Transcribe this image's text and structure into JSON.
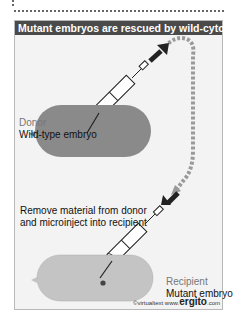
{
  "title": "Mutant embryos are rescued by wild-cytoplasm",
  "donor": {
    "role": "Donor",
    "description": "Wild-type embryo"
  },
  "instruction": {
    "line1": "Remove material from donor",
    "line2": "and microinject into recipient"
  },
  "recipient": {
    "role": "Recipient",
    "description": "Mutant embryo"
  },
  "credit": {
    "prefix": "©virtualtext www.",
    "brand": "ergito",
    "suffix": ".com"
  },
  "colors": {
    "title_bg": "#4a4a4a",
    "donor_embryo": "#8a8a8a",
    "recipient_embryo": "#c4c4c4",
    "panel_bg": "#f3f3f3",
    "arrow_dark": "#222222",
    "arrow_dashed": "#9a9a9a"
  }
}
